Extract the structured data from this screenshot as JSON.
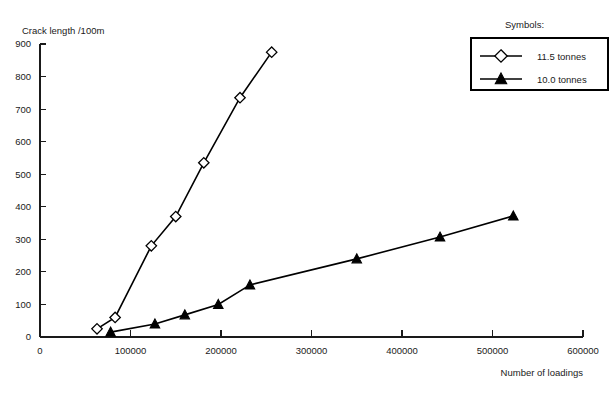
{
  "chart_data": {
    "type": "line",
    "title": "",
    "xlabel": "Number of loadings",
    "ylabel": "Crack length /100m",
    "xlim": [
      0,
      600000
    ],
    "ylim": [
      0,
      900
    ],
    "xticks": [
      0,
      100000,
      200000,
      300000,
      400000,
      500000,
      600000
    ],
    "xtick_labels": [
      "0",
      "100000",
      "200000",
      "300000",
      "400000",
      "500000",
      "600000"
    ],
    "yticks": [
      0,
      100,
      200,
      300,
      400,
      500,
      600,
      700,
      800,
      900
    ],
    "ytick_labels": [
      "0",
      "100",
      "200",
      "300",
      "400",
      "500",
      "600",
      "700",
      "800",
      "900"
    ],
    "grid": false,
    "legend_position": "top-right",
    "legend_heading": "Symbols:",
    "series": [
      {
        "name": "11.5 tonnes",
        "marker": "open-diamond",
        "color": "#000000",
        "points": [
          {
            "x": 63000,
            "y": 25
          },
          {
            "x": 83000,
            "y": 60
          },
          {
            "x": 123000,
            "y": 280
          },
          {
            "x": 150000,
            "y": 370
          },
          {
            "x": 181000,
            "y": 535
          },
          {
            "x": 221000,
            "y": 735
          },
          {
            "x": 256000,
            "y": 875
          }
        ]
      },
      {
        "name": "10.0 tonnes",
        "marker": "filled-triangle",
        "color": "#000000",
        "points": [
          {
            "x": 78000,
            "y": 15
          },
          {
            "x": 127000,
            "y": 40
          },
          {
            "x": 160000,
            "y": 68
          },
          {
            "x": 197000,
            "y": 100
          },
          {
            "x": 232000,
            "y": 160
          },
          {
            "x": 350000,
            "y": 240
          },
          {
            "x": 442000,
            "y": 307
          },
          {
            "x": 523000,
            "y": 372
          }
        ]
      }
    ]
  },
  "legend": {
    "heading": "Symbols:",
    "entries": [
      {
        "label": "11.5 tonnes",
        "marker": "open-diamond"
      },
      {
        "label": "10.0 tonnes",
        "marker": "filled-triangle"
      }
    ]
  },
  "axes": {
    "y_title": "Crack length /100m",
    "x_title": "Number of loadings"
  }
}
